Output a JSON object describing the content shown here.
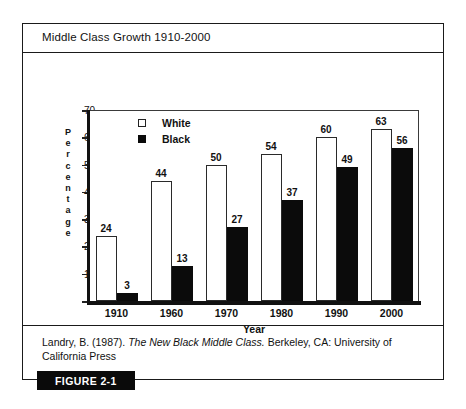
{
  "figure": {
    "title": "Middle Class Growth 1910-2000",
    "badge_label": "FIGURE 2-1",
    "caption_prefix": "Landry, B. (1987). ",
    "caption_italic": "The New Black Middle Class.",
    "caption_suffix": " Berkeley, CA: University of California Press"
  },
  "chart_data": {
    "type": "bar",
    "title": "Middle Class Growth 1910-2000",
    "xlabel": "Year",
    "ylabel": "Percentage",
    "categories": [
      "1910",
      "1960",
      "1970",
      "1980",
      "1990",
      "2000"
    ],
    "series": [
      {
        "name": "White",
        "values": [
          24,
          44,
          50,
          54,
          60,
          63
        ],
        "color": "#ffffff"
      },
      {
        "name": "Black",
        "values": [
          3,
          13,
          27,
          37,
          49,
          56
        ],
        "color": "#0b0b0b"
      }
    ],
    "ylim": [
      0,
      70
    ],
    "yticks": [
      0,
      10,
      20,
      30,
      40,
      50,
      60,
      70
    ],
    "grid": false,
    "legend_position": "top-left",
    "value_labels": true
  }
}
